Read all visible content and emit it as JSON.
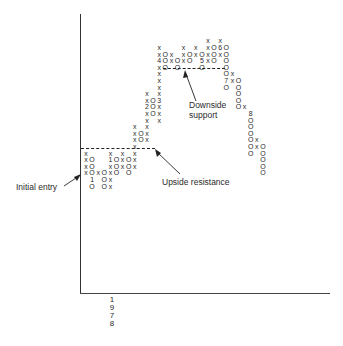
{
  "chart_data": {
    "type": "point-and-figure",
    "title": "",
    "xlabel": "",
    "ylabel": "",
    "grid": false,
    "x_tick_labels": [
      "1978"
    ],
    "annotations": [
      {
        "text": "Initial entry",
        "points_to": "start of first X column at resistance level"
      },
      {
        "text": "Upside resistance",
        "points_to": "dashed line along top of lower congestion"
      },
      {
        "text": "Downside support",
        "points_to": "dashed line along bottom of upper congestion"
      }
    ],
    "columns": [
      {
        "type": "X",
        "cells": [
          "x",
          "x",
          "x",
          "x"
        ],
        "top_row": 16
      },
      {
        "type": "O",
        "cells": [
          "O",
          "O",
          "O",
          "1",
          "O"
        ],
        "top_row": 17,
        "note": "month markers 1,2 in box '12'"
      },
      {
        "type": "X",
        "cells": [
          "x"
        ],
        "top_row": 19
      },
      {
        "type": "O",
        "cells": [
          "O",
          "O",
          "O"
        ],
        "top_row": 19
      },
      {
        "type": "X",
        "cells": [
          "x",
          "1",
          "x",
          "x",
          "x",
          "x"
        ],
        "top_row": 16
      },
      {
        "type": "O",
        "cells": [
          "O",
          "O",
          "O"
        ],
        "top_row": 17
      },
      {
        "type": "X",
        "cells": [
          "x",
          "x",
          "x"
        ],
        "top_row": 16
      },
      {
        "type": "O",
        "cells": [
          "O",
          "O",
          "O"
        ],
        "top_row": 17
      },
      {
        "type": "X",
        "cells": [
          "x",
          "x",
          "x",
          "x",
          "x",
          "x",
          "x"
        ],
        "top_row": 12
      },
      {
        "type": "O",
        "cells": [
          "O",
          "O"
        ],
        "top_row": 13
      },
      {
        "type": "X",
        "cells": [
          "x",
          "x",
          "2",
          "x",
          "x",
          "x",
          "x",
          "x"
        ],
        "top_row": 7
      },
      {
        "type": "O",
        "cells": [
          "O",
          "O",
          "O"
        ],
        "top_row": 8
      },
      {
        "type": "X",
        "cells": [
          "x",
          "x",
          "4",
          "x",
          "x",
          "x",
          "x",
          "x",
          "3",
          "x",
          "x",
          "x"
        ],
        "top_row": 0
      },
      {
        "type": "O",
        "cells": [
          "O",
          "O",
          "O"
        ],
        "top_row": 1
      },
      {
        "type": "X",
        "cells": [
          "x",
          "x"
        ],
        "top_row": 1
      },
      {
        "type": "O",
        "cells": [
          "O",
          "O"
        ],
        "top_row": 2
      },
      {
        "type": "X",
        "cells": [
          "x",
          "x",
          "x"
        ],
        "top_row": 0
      },
      {
        "type": "O",
        "cells": [
          "O",
          "O"
        ],
        "top_row": 1
      },
      {
        "type": "X",
        "cells": [
          "x",
          "x"
        ],
        "top_row": 0
      },
      {
        "type": "O",
        "cells": [
          "O",
          "5",
          "O"
        ],
        "top_row": 1
      },
      {
        "type": "X",
        "cells": [
          "x",
          "x",
          "x",
          "x"
        ],
        "top_row": -1
      },
      {
        "type": "O",
        "cells": [
          "O",
          "O",
          "O"
        ],
        "top_row": 0
      },
      {
        "type": "X",
        "cells": [
          "x",
          "6",
          "x"
        ],
        "top_row": -1
      },
      {
        "type": "O",
        "cells": [
          "O",
          "O",
          "O",
          "O",
          "O",
          "7",
          "O"
        ],
        "top_row": 0
      },
      {
        "type": "X",
        "cells": [
          "x",
          "x"
        ],
        "top_row": 4
      },
      {
        "type": "O",
        "cells": [
          "O",
          "O",
          "O",
          "O",
          "O"
        ],
        "top_row": 5
      },
      {
        "type": "X",
        "cells": [
          "x"
        ],
        "top_row": 9
      },
      {
        "type": "O",
        "cells": [
          "8",
          "O",
          "O",
          "O",
          "O",
          "O",
          "O"
        ],
        "top_row": 10
      },
      {
        "type": "X",
        "cells": [
          "x",
          "x"
        ],
        "top_row": 14
      },
      {
        "type": "O",
        "cells": [
          "O",
          "O",
          "O",
          "O",
          "O"
        ],
        "top_row": 15
      }
    ],
    "resistance_level_row": 15.5,
    "support_level_row": 3.5
  },
  "labels": {
    "initial_entry": "Initial entry",
    "upside_resistance": "Upside resistance",
    "downside_support_line1": "Downside",
    "downside_support_line2": "support"
  },
  "x_axis": {
    "year_digits": [
      "1",
      "9",
      "7",
      "8"
    ]
  }
}
